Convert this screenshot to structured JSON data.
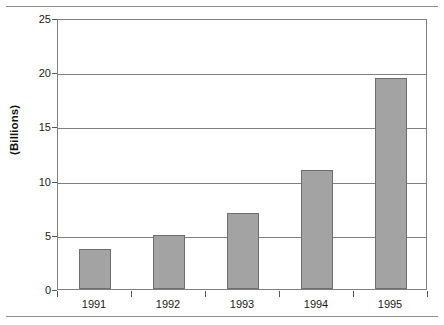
{
  "chart_data": {
    "type": "bar",
    "title": "",
    "subtitle": "",
    "xlabel": "",
    "ylabel": "(Billions)",
    "categories": [
      "1991",
      "1992",
      "1993",
      "1994",
      "1995"
    ],
    "values": [
      3.7,
      5.0,
      7.0,
      11.0,
      19.5
    ],
    "series": [
      {
        "name": "",
        "values": [
          3.7,
          5.0,
          7.0,
          11.0,
          19.5
        ]
      }
    ],
    "ylim": [
      0,
      25
    ],
    "yticks": [
      0,
      5,
      10,
      15,
      20,
      25
    ],
    "ytick_labels": [
      "0",
      "5",
      "10",
      "15",
      "20",
      "25"
    ],
    "grid": "horizontal",
    "legend": "none",
    "bar_color": "#a3a3a3",
    "bar_edge_color": "#6e6e6e",
    "gridline_color": "#808080",
    "axis_color": "#808080",
    "text_color": "#1a1a1a",
    "background": "#ffffff"
  },
  "figure": {
    "top_rule_color": "#8c8c8c",
    "bottom_rule_color": "#8c8c8c"
  }
}
